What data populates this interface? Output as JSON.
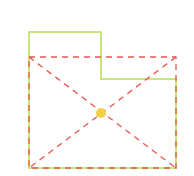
{
  "canvas": {
    "width": 194,
    "height": 176,
    "background": "#ffffff"
  },
  "colors": {
    "polygon_stroke": "#b5e04a",
    "bbox_stroke": "#e8564a",
    "center_fill": "#f5cf4a"
  },
  "polygon": {
    "points": [
      [
        29,
        32
      ],
      [
        101,
        32
      ],
      [
        101,
        79
      ],
      [
        176,
        79
      ],
      [
        176,
        168
      ],
      [
        29,
        168
      ]
    ]
  },
  "bounding_box": {
    "x1": 29,
    "y1": 57,
    "x2": 176,
    "y2": 168
  },
  "center_point": {
    "x": 101,
    "y": 113,
    "r": 5
  }
}
